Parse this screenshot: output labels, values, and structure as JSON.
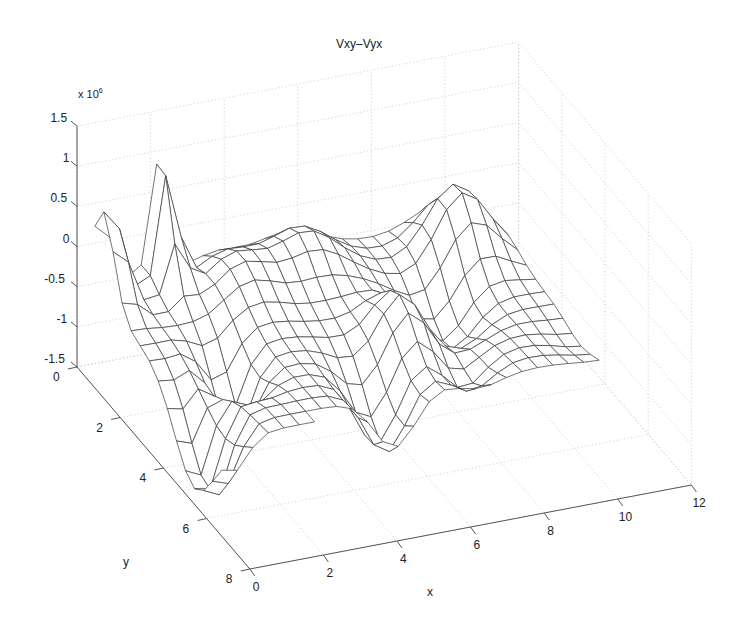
{
  "chart_data": {
    "type": "surface",
    "title": "Vxy–Vyx",
    "xlabel": "x",
    "ylabel": "y",
    "zlabel": "",
    "z_multiplier": "x 10^6",
    "z_multiplier_base": "x 10",
    "z_multiplier_exp": "6",
    "xlim": [
      0,
      12
    ],
    "ylim": [
      0,
      8
    ],
    "zlim": [
      -1.5,
      1.5
    ],
    "x_ticks": [
      "0",
      "2",
      "4",
      "6",
      "8",
      "10",
      "12"
    ],
    "y_ticks": [
      "0",
      "2",
      "4",
      "6",
      "8"
    ],
    "z_ticks": [
      "-1.5",
      "-1",
      "-0.5",
      "0",
      "0.5",
      "1",
      "1.5"
    ],
    "grid": true,
    "style": "wireframe mesh, black lines on white, dotted gray 3D grid",
    "view": "MATLAB default-like 3D view, x along front-right edge, y along front-left edge",
    "surface_features": [
      {
        "description": "tall spike near x=0.5, y=1",
        "approx_z": 0.0
      },
      {
        "description": "deep trough near x=0.5, y=5",
        "approx_z": -1.5
      },
      {
        "description": "tall spike near x=2, y=1",
        "approx_z": 0.8
      },
      {
        "description": "trough near x=2, y=3.5",
        "approx_z": -1.0
      },
      {
        "description": "rolling ridges between x=3..10",
        "approx_z_range": [
          -1.2,
          0.5
        ]
      },
      {
        "description": "peak near x=10, y=2",
        "approx_z": 0.4
      },
      {
        "description": "wing near x=11, y=5",
        "approx_z": -0.5
      }
    ]
  },
  "axes_labels": {
    "title": "Vxy–Vyx",
    "x": "x",
    "y": "y",
    "z_exp_base": "x 10",
    "z_exp_power": "6"
  },
  "ticks": {
    "x": [
      "0",
      "2",
      "4",
      "6",
      "8",
      "10",
      "12"
    ],
    "y": [
      "0",
      "2",
      "4",
      "6",
      "8"
    ],
    "z": [
      "1.5",
      "1",
      "0.5",
      "0",
      "-0.5",
      "-1",
      "-1.5"
    ]
  }
}
